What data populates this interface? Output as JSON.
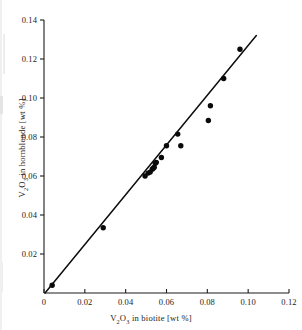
{
  "chart_data": {
    "type": "scatter",
    "title": "",
    "xlabel": "V2O3 in biotite [wt %]",
    "ylabel": "V2O3 in hornblende [wt %]",
    "xlim": [
      0,
      0.12
    ],
    "ylim": [
      0,
      0.14
    ],
    "xticks": [
      0,
      0.02,
      0.04,
      0.06,
      0.08,
      0.1,
      0.12
    ],
    "yticks": [
      0.02,
      0.04,
      0.06,
      0.08,
      0.1,
      0.12,
      0.14
    ],
    "xtick_labels": [
      "0",
      "0.02",
      "0.04",
      "0.06",
      "0.08",
      "0.10",
      "0.12"
    ],
    "ytick_labels": [
      "0.02",
      "0.04",
      "0.06",
      "0.08",
      "0.10",
      "0.12",
      "0.14"
    ],
    "grid": false,
    "legend": null,
    "marker": "filled-circle",
    "marker_color": "#0a0a0a",
    "line_color": "#0d0d0d",
    "points": [
      {
        "x": 0.004,
        "y": 0.004
      },
      {
        "x": 0.029,
        "y": 0.0335
      },
      {
        "x": 0.0495,
        "y": 0.06
      },
      {
        "x": 0.051,
        "y": 0.0615
      },
      {
        "x": 0.052,
        "y": 0.062
      },
      {
        "x": 0.053,
        "y": 0.0635
      },
      {
        "x": 0.0535,
        "y": 0.064
      },
      {
        "x": 0.054,
        "y": 0.0645
      },
      {
        "x": 0.0545,
        "y": 0.0665
      },
      {
        "x": 0.055,
        "y": 0.067
      },
      {
        "x": 0.0575,
        "y": 0.0695
      },
      {
        "x": 0.06,
        "y": 0.0755
      },
      {
        "x": 0.0655,
        "y": 0.0815
      },
      {
        "x": 0.067,
        "y": 0.0755
      },
      {
        "x": 0.0805,
        "y": 0.0885
      },
      {
        "x": 0.0815,
        "y": 0.096
      },
      {
        "x": 0.088,
        "y": 0.11
      },
      {
        "x": 0.096,
        "y": 0.125
      }
    ],
    "fit_line": {
      "type": "linear",
      "x_start": 0.0005,
      "y_start": 0.0,
      "x_end": 0.104,
      "y_end": 0.132
    }
  },
  "axis_titles": {
    "x_prefix": "V",
    "x_sub1": "2",
    "x_mid": "O",
    "x_sub2": "3",
    "x_suffix": " in biotite [wt %]",
    "y_prefix": "V",
    "y_sub1": "2",
    "y_mid": "O",
    "y_sub2": "3",
    "y_suffix": " in hornblende [wt %]"
  }
}
